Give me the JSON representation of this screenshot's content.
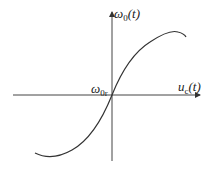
{
  "diagram": {
    "type": "transfer-characteristic",
    "axes": {
      "y_label": {
        "main": "ω",
        "sub": "0",
        "arg": "(t)"
      },
      "x_label": {
        "main": "u",
        "sub": "c",
        "arg": "(t)"
      },
      "origin_label": {
        "main": "ω",
        "sub": "0r"
      }
    },
    "curve": {
      "shape": "odd-symmetric S-curve through origin",
      "description": "Frequency ω0(t) vs control voltage uc(t), passing through ω0r at origin"
    },
    "colors": {
      "line": "#333333",
      "background": "#ffffff"
    }
  }
}
